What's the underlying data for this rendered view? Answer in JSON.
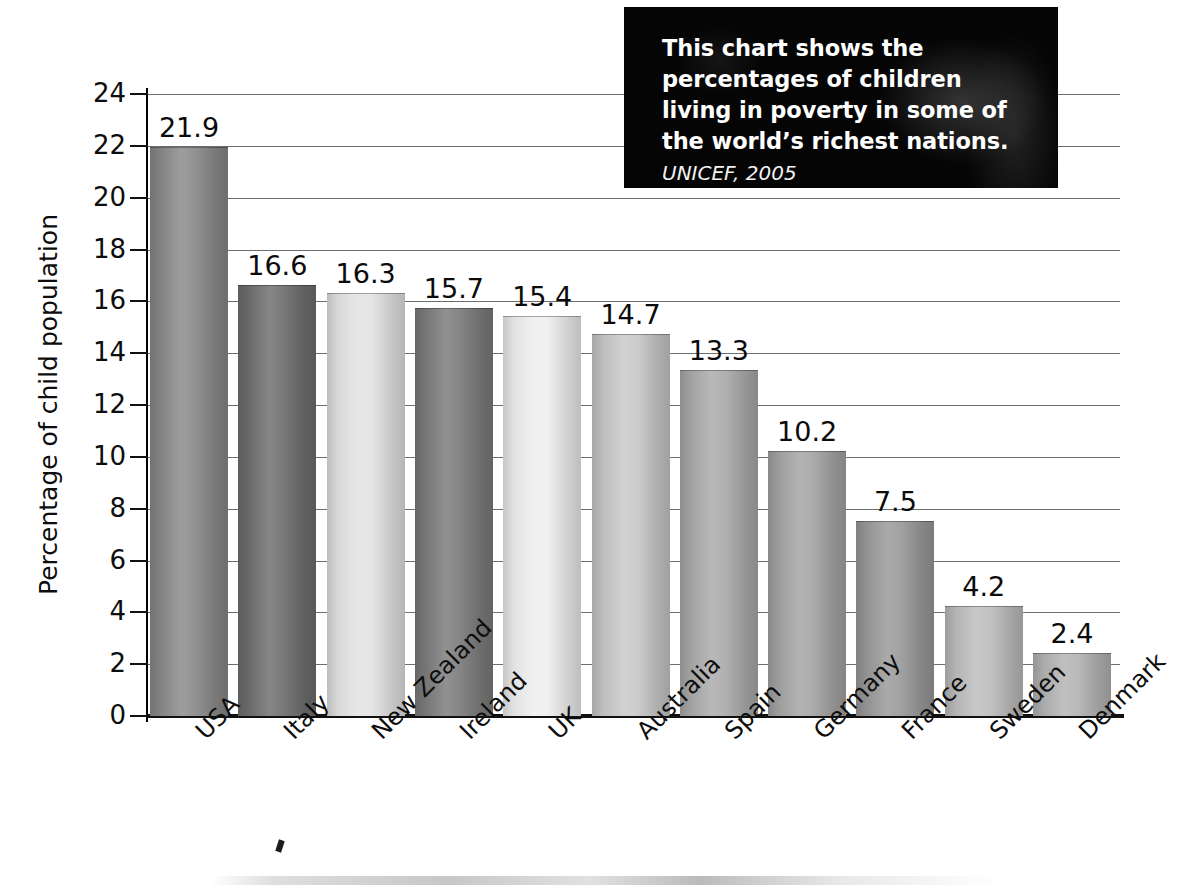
{
  "caption": {
    "main_text": "This chart shows the percentages of children living in poverty in some of the world’s richest nations.",
    "source": "UNICEF, 2005",
    "background_color": "#050505",
    "text_color": "#ffffff"
  },
  "chart_data": {
    "type": "bar",
    "title": "",
    "xlabel": "",
    "ylabel": "Percentage of child population",
    "ylim": [
      0,
      24
    ],
    "ytick_step": 2,
    "grid": true,
    "legend": "none",
    "value_label_format": "one-decimal",
    "categories": [
      "USA",
      "Italy",
      "New Zealand",
      "Ireland",
      "UK",
      "Australia",
      "Spain",
      "Germany",
      "France",
      "Sweden",
      "Denmark"
    ],
    "values": [
      21.9,
      16.6,
      16.3,
      15.7,
      15.4,
      14.7,
      13.3,
      10.2,
      7.5,
      4.2,
      2.4
    ],
    "yticks": [
      "0",
      "2",
      "4",
      "6",
      "8",
      "10",
      "12",
      "14",
      "16",
      "18",
      "20",
      "22",
      "24"
    ],
    "bar_colors": [
      "#8a8a8a",
      "#6f6f6f",
      "#e3e3e3",
      "#7c7c7c",
      "#eeeeee",
      "#c8c8c8",
      "#ababab",
      "#a5a5a5",
      "#9a9a9a",
      "#bdbdbd",
      "#b4b4b4"
    ]
  }
}
